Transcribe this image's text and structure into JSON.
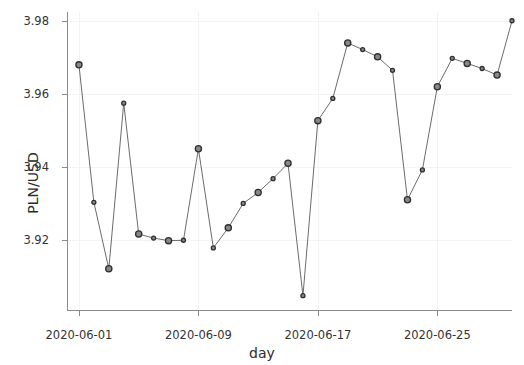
{
  "chart_data": {
    "type": "line",
    "title": "",
    "xlabel": "day",
    "ylabel": "PLN/USD",
    "ylim": [
      3.9005,
      3.9825
    ],
    "yticks": [
      "3.92",
      "3.94",
      "3.96",
      "3.98"
    ],
    "ytick_values": [
      3.92,
      3.94,
      3.96,
      3.98
    ],
    "xticks": [
      "2020-06-01",
      "2020-06-09",
      "2020-06-17",
      "2020-06-25"
    ],
    "xtick_values": [
      1,
      9,
      17,
      25
    ],
    "xlim": [
      0.2,
      30.0
    ],
    "grid": true,
    "legend": false,
    "markers": "circle",
    "series": [
      {
        "name": "PLN/USD",
        "x": [
          1,
          2,
          3,
          4,
          5,
          6,
          7,
          8,
          9,
          10,
          11,
          12,
          13,
          14,
          15,
          16,
          17,
          18,
          19,
          20,
          21,
          22,
          23,
          24,
          25,
          26,
          27,
          28,
          29,
          30
        ],
        "categories": [
          "2020-06-01",
          "2020-06-02",
          "2020-06-03",
          "2020-06-04",
          "2020-06-05",
          "2020-06-06",
          "2020-06-07",
          "2020-06-08",
          "2020-06-09",
          "2020-06-10",
          "2020-06-11",
          "2020-06-12",
          "2020-06-13",
          "2020-06-14",
          "2020-06-15",
          "2020-06-16",
          "2020-06-17",
          "2020-06-18",
          "2020-06-19",
          "2020-06-20",
          "2020-06-21",
          "2020-06-22",
          "2020-06-23",
          "2020-06-24",
          "2020-06-25",
          "2020-06-26",
          "2020-06-27",
          "2020-06-28",
          "2020-06-29",
          "2020-06-30"
        ],
        "values": [
          3.968,
          3.9303,
          3.9121,
          3.9575,
          3.9216,
          3.9205,
          3.9198,
          3.9199,
          3.945,
          3.9178,
          3.9233,
          3.93,
          3.933,
          3.9368,
          3.941,
          3.9047,
          3.9527,
          3.9588,
          3.974,
          3.9722,
          3.9702,
          3.9665,
          3.931,
          3.9392,
          3.962,
          3.9698,
          3.9684,
          3.967,
          3.9652,
          3.9801
        ]
      }
    ]
  },
  "colors": {
    "line": "#5a5a5a",
    "marker_fill": "#888888",
    "marker_edge": "#2f2f2f",
    "grid": "#f3f3f3",
    "axis": "#8a8a8a",
    "text": "#333333",
    "background": "#ffffff"
  }
}
